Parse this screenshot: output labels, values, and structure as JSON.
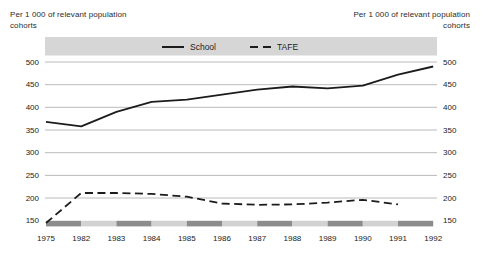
{
  "titles": {
    "left_line1": "Per 1 000 of relevant population",
    "left_line2": "cohorts",
    "right_line1": "Per 1 000 of relevant population",
    "right_line2": "cohorts"
  },
  "chart_data": {
    "type": "line",
    "title": "",
    "ylabel_left": "Per 1 000 of relevant population cohorts",
    "ylabel_right": "Per 1 000 of relevant population cohorts",
    "categories": [
      "1975",
      "1982",
      "1983",
      "1984",
      "1985",
      "1986",
      "1987",
      "1988",
      "1989",
      "1990",
      "1991",
      "1992"
    ],
    "series": [
      {
        "name": "School",
        "style": "solid",
        "values": [
          368,
          358,
          390,
          412,
          417,
          428,
          439,
          446,
          442,
          448,
          472,
          490
        ]
      },
      {
        "name": "TAFE",
        "style": "dashed",
        "values": [
          145,
          211,
          211,
          209,
          203,
          188,
          185,
          186,
          190,
          196,
          186,
          null
        ]
      }
    ],
    "ylim": [
      150,
      500
    ],
    "yticks": [
      150,
      200,
      250,
      300,
      350,
      400,
      450,
      500
    ],
    "grid": "horizontal",
    "legend_position": "top-band",
    "axis_band_pattern": [
      "dark",
      "light",
      "dark",
      "light",
      "dark",
      "light",
      "dark",
      "light",
      "dark",
      "light",
      "dark"
    ],
    "colors": {
      "line": "#1c1c1c",
      "gridline": "#a8a8a8",
      "legend_band": "#d6d6d6",
      "axis_band_dark": "#8c8c8c",
      "axis_band_light": "#d2d2d2",
      "text": "#222222"
    }
  }
}
